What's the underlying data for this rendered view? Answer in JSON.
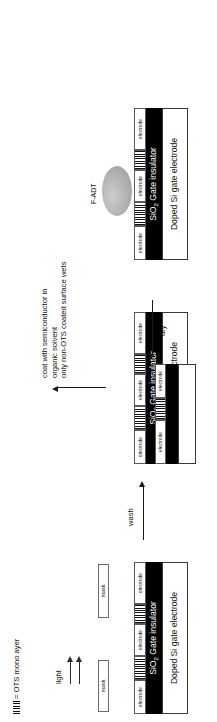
{
  "figure": {
    "type": "process-flow-diagram",
    "orientation": "rotated-90"
  },
  "legend": {
    "symbol_name": "ots-hatch-symbol",
    "equals": "=",
    "text": "OTS mono ayer"
  },
  "labels": {
    "electrode": "electrode",
    "mask": "mask",
    "insulator": "SiO",
    "insulator_sub": "2",
    "insulator_rest": " Gate insulator",
    "substrate": "Doped Si gate electrode",
    "fadt": "F-ADT"
  },
  "steps": {
    "light": "light",
    "wash": "wash",
    "coat": "coat with semiconductor in\norganic solvent\nonly non-OTS coated surface wets",
    "dry": "dry"
  },
  "panels": [
    {
      "id": "panel-1",
      "name": "masked-exposure-panel",
      "caption_insulator": "SiO",
      "caption_substrate": "Doped Si gate electrode",
      "has_masks": true,
      "has_light": true
    },
    {
      "id": "panel-2",
      "name": "post-exposure-panel",
      "caption_insulator": "SiO",
      "caption_substrate": "Doped Si gate electrode",
      "has_masks": false,
      "has_light": false
    },
    {
      "id": "panel-3",
      "name": "washed-panel",
      "caption_insulator": "SiO",
      "caption_substrate": "Doped Si gate electrode",
      "has_masks": false,
      "has_light": false
    },
    {
      "id": "panel-4",
      "name": "semiconductor-coated-panel",
      "caption_insulator": "SiO",
      "caption_substrate": "Doped Si gate electrode",
      "has_droplet": true
    }
  ],
  "colors": {
    "insulator": "#000000",
    "substrate": "#ffffff",
    "outline": "#3a3a3a",
    "droplet": "#a9a9a9",
    "text": "#111111"
  }
}
